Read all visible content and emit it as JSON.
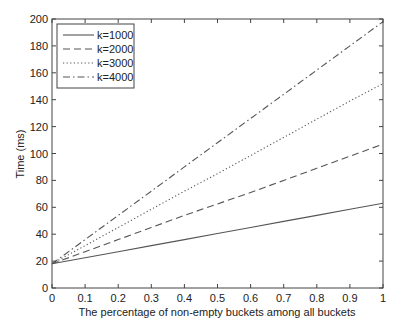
{
  "chart_data": {
    "type": "line",
    "title": "",
    "xlabel": "The percentage of non-empty buckets among all buckets",
    "ylabel": "Time (ms)",
    "xlim": [
      0,
      1
    ],
    "ylim": [
      0,
      200
    ],
    "xticks": [
      0,
      0.1,
      0.2,
      0.3,
      0.4,
      0.5,
      0.6,
      0.7,
      0.8,
      0.9,
      1
    ],
    "xtick_labels": [
      "0",
      "0.1",
      "0.2",
      "0.3",
      "0.4",
      "0.5",
      "0.6",
      "0.7",
      "0.8",
      "0.9",
      "1"
    ],
    "yticks": [
      0,
      20,
      40,
      60,
      80,
      100,
      120,
      140,
      160,
      180,
      200
    ],
    "ytick_labels": [
      "0",
      "20",
      "40",
      "60",
      "80",
      "100",
      "120",
      "140",
      "160",
      "180",
      "200"
    ],
    "grid": false,
    "legend_position": "upper left",
    "x": [
      0,
      0.1,
      0.2,
      0.3,
      0.4,
      0.5,
      0.6,
      0.7,
      0.8,
      0.9,
      1
    ],
    "series": [
      {
        "name": "k=1000",
        "style": "solid",
        "values": [
          18,
          22.5,
          27,
          31.5,
          36,
          40.5,
          45,
          49.5,
          54,
          58.5,
          63
        ]
      },
      {
        "name": "k=2000",
        "style": "dashed",
        "values": [
          18,
          27,
          36,
          45,
          54,
          62.5,
          71,
          80,
          89,
          98,
          107
        ]
      },
      {
        "name": "k=3000",
        "style": "dotted",
        "values": [
          18,
          31.5,
          45,
          58.5,
          72,
          85,
          98.5,
          112,
          125.5,
          139,
          152
        ]
      },
      {
        "name": "k=4000",
        "style": "dashdot",
        "values": [
          18,
          36,
          54,
          72,
          90,
          108,
          126,
          144,
          162,
          180,
          198
        ]
      }
    ]
  }
}
